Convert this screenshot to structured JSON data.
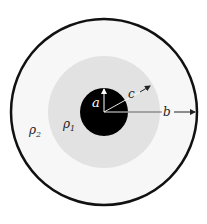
{
  "diagram": {
    "labels": {
      "a": "a",
      "b": "b",
      "c": "c",
      "rho1": "ρ",
      "rho1_sub": "1",
      "rho2": "ρ",
      "rho2_sub": "2"
    },
    "regions": [
      {
        "name": "inner-core",
        "radius_label": "a",
        "color": "#000000"
      },
      {
        "name": "shell-1",
        "radius_label": "c",
        "medium": "rho1",
        "color": "#e2e2e2"
      },
      {
        "name": "shell-2",
        "radius_label": "b",
        "medium": "rho2",
        "color": "#f7f7f7"
      }
    ],
    "colors": {
      "outer_border": "#111111",
      "arrow": "#ffffff",
      "arrow_outside": "#222222"
    }
  }
}
